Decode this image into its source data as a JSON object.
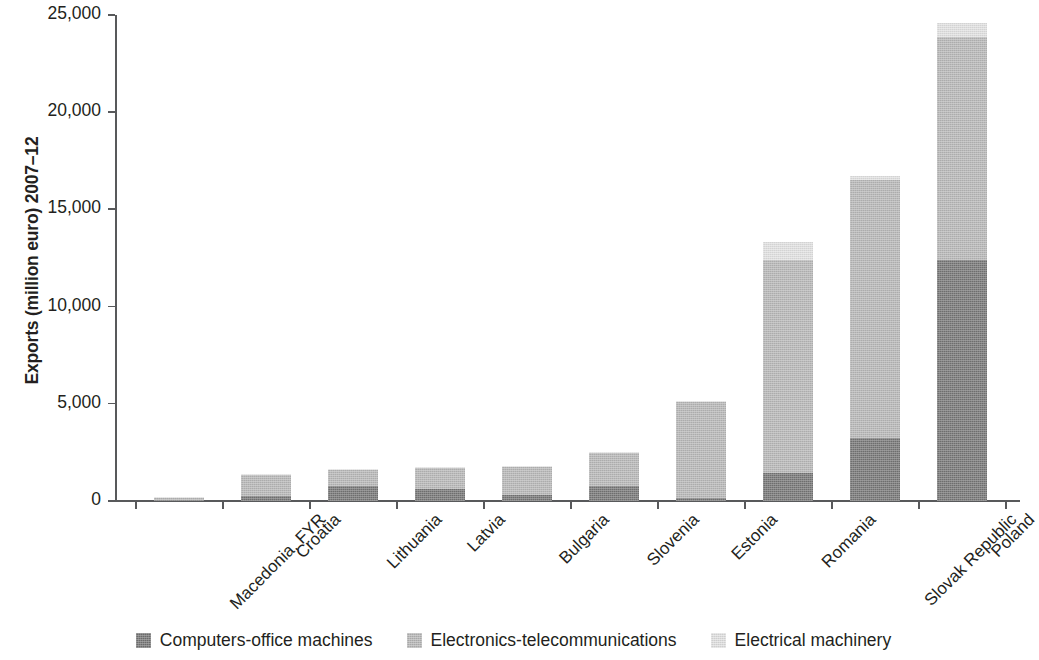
{
  "chart_data": {
    "type": "bar",
    "subtype": "stacked-vertical",
    "title": "",
    "xlabel": "",
    "ylabel": "Exports (million euro) 2007–12",
    "ylim": [
      0,
      25000
    ],
    "ytick_labels": [
      "0",
      "5,000",
      "10,000",
      "15,000",
      "20,000",
      "25,000"
    ],
    "ytick_values": [
      0,
      5000,
      10000,
      15000,
      20000,
      25000
    ],
    "grid": false,
    "legend_position": "bottom",
    "categories": [
      "Macedonia, FYR",
      "Croatia",
      "Lithuania",
      "Latvia",
      "Bulgaria",
      "Slovenia",
      "Estonia",
      "Romania",
      "Slovak Republic",
      "Poland"
    ],
    "series": [
      {
        "name": "Computers-office machines",
        "color": "#767676",
        "values": [
          60,
          250,
          750,
          600,
          300,
          750,
          150,
          1450,
          3250,
          12400
        ]
      },
      {
        "name": "Electronics-telecommunications",
        "color": "#b8b8b8",
        "values": [
          100,
          1100,
          850,
          1100,
          1450,
          1700,
          4950,
          10950,
          13250,
          11450
        ]
      },
      {
        "name": "Electrical machinery",
        "color": "#e2e2e2",
        "values": [
          40,
          50,
          50,
          50,
          50,
          50,
          50,
          950,
          200,
          750
        ]
      }
    ],
    "totals": [
      200,
      1400,
      1650,
      1750,
      1800,
      2500,
      5150,
      13350,
      16700,
      24600
    ]
  },
  "legend": {
    "items": [
      {
        "label": "Computers-office machines",
        "color": "#767676"
      },
      {
        "label": "Electronics-telecommunications",
        "color": "#b8b8b8"
      },
      {
        "label": "Electrical machinery",
        "color": "#e2e2e2"
      }
    ]
  }
}
